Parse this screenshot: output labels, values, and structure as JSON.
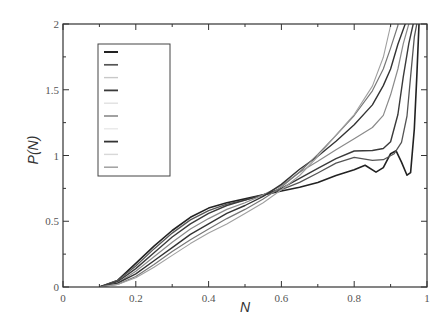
{
  "chart_data": {
    "type": "line",
    "title": "",
    "xlabel": "N",
    "ylabel": "P(N)",
    "xlim": [
      0,
      1
    ],
    "ylim": [
      0,
      2
    ],
    "x_ticks": [
      0,
      0.2,
      0.4,
      0.6,
      0.8,
      1
    ],
    "x_tick_labels": [
      "0",
      "0.2",
      "0.4",
      "0.6",
      "0.8",
      "1"
    ],
    "y_ticks": [
      0,
      0.5,
      1,
      1.5,
      2
    ],
    "y_tick_labels": [
      "0",
      "0.5",
      "1",
      "1.5",
      "2"
    ],
    "grid": false,
    "legend": {
      "position": "upper-left",
      "entries_visible_labels": false,
      "entry_count": 10
    },
    "series": [
      {
        "name": "series-1",
        "color": "#222222",
        "width": 1.6,
        "x": [
          0.1,
          0.15,
          0.2,
          0.25,
          0.3,
          0.35,
          0.4,
          0.45,
          0.5,
          0.55,
          0.6,
          0.65,
          0.7,
          0.75,
          0.8,
          0.83,
          0.86,
          0.88,
          0.9,
          0.915,
          0.93,
          0.945,
          0.955,
          0.965,
          0.972,
          0.978
        ],
        "y": [
          0.0,
          0.05,
          0.18,
          0.31,
          0.43,
          0.53,
          0.6,
          0.64,
          0.67,
          0.7,
          0.73,
          0.77,
          0.8,
          0.84,
          0.88,
          0.92,
          0.88,
          0.92,
          1.02,
          1.03,
          0.95,
          0.85,
          0.87,
          1.2,
          1.6,
          2.0
        ]
      },
      {
        "name": "series-2",
        "color": "#555555",
        "width": 1.3,
        "x": [
          0.1,
          0.15,
          0.2,
          0.25,
          0.3,
          0.35,
          0.4,
          0.45,
          0.5,
          0.55,
          0.6,
          0.65,
          0.7,
          0.75,
          0.8,
          0.85,
          0.88,
          0.91,
          0.93,
          0.945,
          0.955,
          0.965,
          0.972
        ],
        "y": [
          0.0,
          0.05,
          0.16,
          0.29,
          0.41,
          0.51,
          0.58,
          0.63,
          0.66,
          0.7,
          0.74,
          0.8,
          0.86,
          0.93,
          0.98,
          0.97,
          0.98,
          1.02,
          1.1,
          1.3,
          1.6,
          1.9,
          2.0
        ]
      },
      {
        "name": "series-3",
        "color": "#3a3a3a",
        "width": 1.4,
        "x": [
          0.1,
          0.15,
          0.2,
          0.25,
          0.3,
          0.35,
          0.4,
          0.45,
          0.5,
          0.55,
          0.6,
          0.65,
          0.7,
          0.75,
          0.8,
          0.85,
          0.88,
          0.9,
          0.92,
          0.935,
          0.95,
          0.962
        ],
        "y": [
          0.0,
          0.04,
          0.14,
          0.26,
          0.38,
          0.48,
          0.56,
          0.62,
          0.66,
          0.7,
          0.75,
          0.82,
          0.89,
          0.97,
          1.04,
          1.05,
          1.06,
          1.1,
          1.3,
          1.6,
          1.85,
          2.0
        ]
      },
      {
        "name": "series-4",
        "color": "#8a8a8a",
        "width": 1.2,
        "x": [
          0.1,
          0.15,
          0.2,
          0.25,
          0.3,
          0.35,
          0.4,
          0.45,
          0.5,
          0.55,
          0.6,
          0.65,
          0.7,
          0.75,
          0.8,
          0.85,
          0.88,
          0.9,
          0.92,
          0.935,
          0.95
        ],
        "y": [
          0.0,
          0.03,
          0.12,
          0.23,
          0.34,
          0.44,
          0.52,
          0.59,
          0.64,
          0.7,
          0.77,
          0.86,
          0.95,
          1.05,
          1.14,
          1.22,
          1.3,
          1.45,
          1.65,
          1.85,
          2.0
        ]
      },
      {
        "name": "series-5",
        "color": "#333333",
        "width": 1.4,
        "x": [
          0.1,
          0.15,
          0.2,
          0.25,
          0.3,
          0.35,
          0.4,
          0.45,
          0.5,
          0.55,
          0.6,
          0.65,
          0.7,
          0.75,
          0.8,
          0.85,
          0.88,
          0.9,
          0.92,
          0.94
        ],
        "y": [
          0.0,
          0.03,
          0.1,
          0.2,
          0.3,
          0.4,
          0.48,
          0.56,
          0.62,
          0.69,
          0.78,
          0.89,
          1.0,
          1.12,
          1.24,
          1.38,
          1.52,
          1.65,
          1.85,
          2.0
        ]
      },
      {
        "name": "series-6",
        "color": "#777777",
        "width": 1.2,
        "x": [
          0.1,
          0.15,
          0.2,
          0.25,
          0.3,
          0.35,
          0.4,
          0.45,
          0.5,
          0.55,
          0.6,
          0.65,
          0.7,
          0.75,
          0.8,
          0.85,
          0.88,
          0.9,
          0.92
        ],
        "y": [
          0.0,
          0.02,
          0.08,
          0.17,
          0.27,
          0.36,
          0.44,
          0.52,
          0.59,
          0.67,
          0.76,
          0.88,
          1.02,
          1.16,
          1.3,
          1.48,
          1.65,
          1.82,
          2.0
        ]
      },
      {
        "name": "series-7",
        "color": "#a0a0a0",
        "width": 1.1,
        "x": [
          0.1,
          0.15,
          0.2,
          0.25,
          0.3,
          0.35,
          0.4,
          0.45,
          0.5,
          0.55,
          0.6,
          0.65,
          0.7,
          0.75,
          0.8,
          0.85,
          0.88,
          0.9
        ],
        "y": [
          0.0,
          0.02,
          0.07,
          0.15,
          0.24,
          0.33,
          0.41,
          0.48,
          0.56,
          0.64,
          0.74,
          0.86,
          1.0,
          1.15,
          1.3,
          1.52,
          1.75,
          2.0
        ]
      }
    ]
  },
  "legend_entries": [
    {
      "color": "#222222",
      "width": 1.6
    },
    {
      "color": "#555555",
      "width": 1.3
    },
    {
      "color": "#c8c8c8",
      "width": 1.0
    },
    {
      "color": "#3a3a3a",
      "width": 1.4
    },
    {
      "color": "#e0e0e0",
      "width": 1.0
    },
    {
      "color": "#8a8a8a",
      "width": 1.2
    },
    {
      "color": "#e8e8e8",
      "width": 1.0
    },
    {
      "color": "#333333",
      "width": 1.4
    },
    {
      "color": "#d8d8d8",
      "width": 1.0
    },
    {
      "color": "#a0a0a0",
      "width": 1.1
    }
  ]
}
